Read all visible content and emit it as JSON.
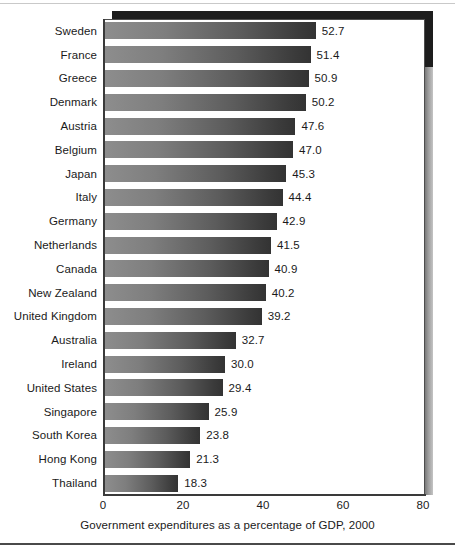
{
  "chart_data": {
    "type": "bar",
    "orientation": "horizontal",
    "title": "",
    "xlabel": "Government expenditures as a percentage of GDP, 2000",
    "ylabel": "",
    "xlim": [
      0,
      80
    ],
    "xticks": [
      "0",
      "20",
      "40",
      "60",
      "80"
    ],
    "grid": false,
    "legend": null,
    "categories": [
      "Sweden",
      "France",
      "Greece",
      "Denmark",
      "Austria",
      "Belgium",
      "Japan",
      "Italy",
      "Germany",
      "Netherlands",
      "Canada",
      "New Zealand",
      "United Kingdom",
      "Australia",
      "Ireland",
      "United States",
      "Singapore",
      "South Korea",
      "Hong Kong",
      "Thailand"
    ],
    "values": [
      52.7,
      51.4,
      50.9,
      50.2,
      47.6,
      47.0,
      45.3,
      44.4,
      42.9,
      41.5,
      40.9,
      40.2,
      39.2,
      32.7,
      30.0,
      29.4,
      25.9,
      23.8,
      21.3,
      18.3
    ],
    "value_labels": [
      "52.7",
      "51.4",
      "50.9",
      "50.2",
      "47.6",
      "47.0",
      "45.3",
      "44.4",
      "42.9",
      "41.5",
      "40.9",
      "40.2",
      "39.2",
      "32.7",
      "30.0",
      "29.4",
      "25.9",
      "23.8",
      "21.3",
      "18.3"
    ],
    "colors": {
      "bar_gradient_start": "#8d8d8d",
      "bar_gradient_end": "#333333",
      "axis": "#3a3a3a",
      "text": "#1a1a1a",
      "frame": "#4d4d4d",
      "shadow": "#1d1d1d",
      "background": "#ffffff"
    }
  }
}
